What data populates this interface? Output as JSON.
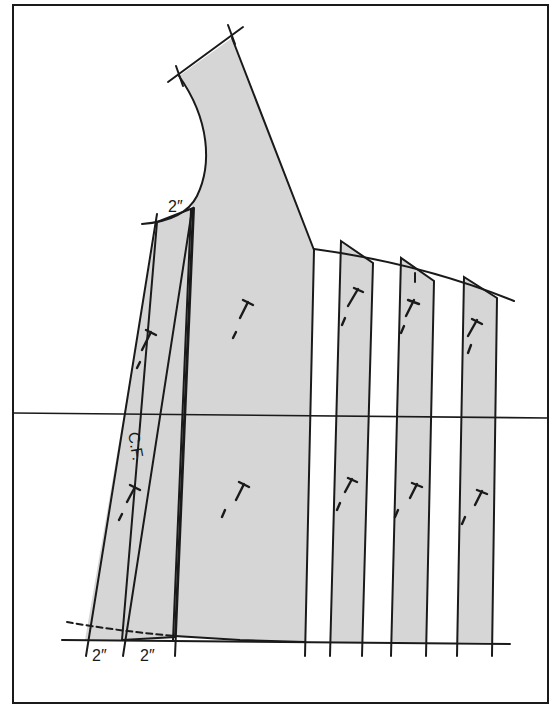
{
  "figure": {
    "type": "pattern-slash-and-spread",
    "frame_color": "#1a1a1a",
    "shade_color": "#d6d6d6",
    "labels": {
      "neck_measure": "2″",
      "center_front": "C.F.",
      "bottom_measure_left": "2″",
      "bottom_measure_right": "2″"
    },
    "pieces": [
      {
        "name": "center-front-strip",
        "grainlines": 2
      },
      {
        "name": "main-bodice-panel",
        "grainlines": 2
      },
      {
        "name": "slash-strip-1",
        "grainlines": 2
      },
      {
        "name": "slash-strip-2",
        "grainlines": 2
      },
      {
        "name": "slash-strip-3",
        "grainlines": 2
      }
    ],
    "guide_lines": [
      "horizontal-waist-line",
      "hem-baseline",
      "dashed-original-hemline"
    ]
  }
}
